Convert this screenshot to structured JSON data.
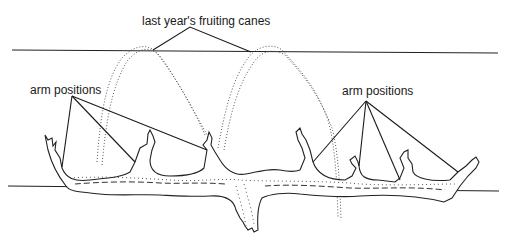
{
  "diagram": {
    "labels": {
      "canes": "last year's fruiting canes",
      "arms_left": "arm positions",
      "arms_right": "arm positions"
    },
    "elements": {
      "top_wire": "upper trellis wire",
      "bottom_wire": "lower trellis wire",
      "trunk": "vine trunk with cordon arms",
      "canes": "dotted arching canes (2)"
    },
    "colors": {
      "ink": "#1a1a1a",
      "background": "#ffffff"
    }
  }
}
